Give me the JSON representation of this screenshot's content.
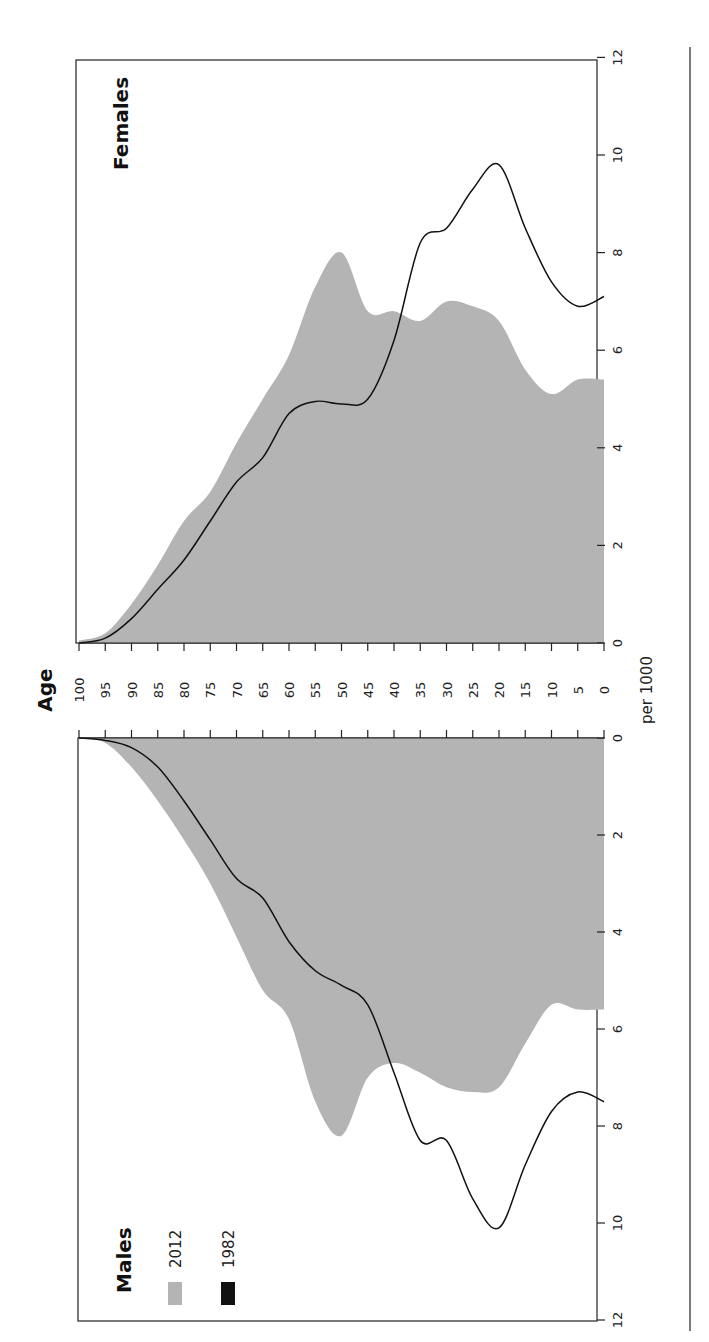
{
  "chart_data": {
    "type": "area",
    "orientation": "rotated 90 degrees counter-clockwise",
    "age_axis": {
      "label": "Age",
      "ticks": [
        "100",
        "95",
        "90",
        "85",
        "80",
        "75",
        "70",
        "65",
        "60",
        "55",
        "50",
        "45",
        "40",
        "35",
        "30",
        "25",
        "20",
        "15",
        "10",
        "5",
        "0"
      ]
    },
    "value_axis": {
      "label": "per 1000",
      "ticks": [
        "0",
        "2",
        "4",
        "6",
        "8",
        "10",
        "12"
      ],
      "range": [
        0,
        12
      ]
    },
    "legend": [
      {
        "label": "2012",
        "style": "grey fill",
        "color": "#b4b4b4"
      },
      {
        "label": "1982",
        "style": "black line",
        "color": "#111111"
      }
    ],
    "ages": [
      0,
      5,
      10,
      15,
      20,
      25,
      30,
      35,
      40,
      45,
      50,
      55,
      60,
      65,
      70,
      75,
      80,
      85,
      90,
      95,
      100
    ],
    "panels": [
      {
        "name": "Females",
        "series": [
          {
            "name": "2012",
            "values": [
              5.4,
              5.4,
              5.1,
              5.6,
              6.6,
              6.9,
              7.0,
              6.6,
              6.8,
              6.8,
              8.0,
              7.3,
              5.9,
              5.0,
              4.1,
              3.1,
              2.5,
              1.6,
              0.8,
              0.2,
              0.05
            ]
          },
          {
            "name": "1982",
            "values": [
              7.1,
              6.9,
              7.4,
              8.5,
              9.8,
              9.3,
              8.5,
              8.2,
              6.2,
              5.0,
              4.9,
              4.95,
              4.7,
              3.8,
              3.3,
              2.5,
              1.7,
              1.1,
              0.5,
              0.1,
              0.0
            ]
          }
        ]
      },
      {
        "name": "Males",
        "series": [
          {
            "name": "2012",
            "values": [
              5.6,
              5.6,
              5.5,
              6.3,
              7.2,
              7.3,
              7.2,
              6.9,
              6.7,
              7.0,
              8.2,
              7.5,
              5.8,
              5.2,
              4.1,
              3.0,
              2.1,
              1.3,
              0.6,
              0.1,
              0.0
            ]
          },
          {
            "name": "1982",
            "values": [
              7.5,
              7.3,
              7.7,
              8.8,
              10.1,
              9.5,
              8.3,
              8.3,
              6.9,
              5.5,
              5.1,
              4.8,
              4.2,
              3.3,
              2.9,
              2.1,
              1.3,
              0.6,
              0.2,
              0.05,
              0.0
            ]
          }
        ]
      }
    ]
  },
  "labels": {
    "females": "Females",
    "males": "Males",
    "age": "Age",
    "per1000": "per 1000",
    "legend_2012": "2012",
    "legend_1982": "1982"
  },
  "colors": {
    "fill_2012": "#b4b4b4",
    "line_1982": "#111111"
  }
}
